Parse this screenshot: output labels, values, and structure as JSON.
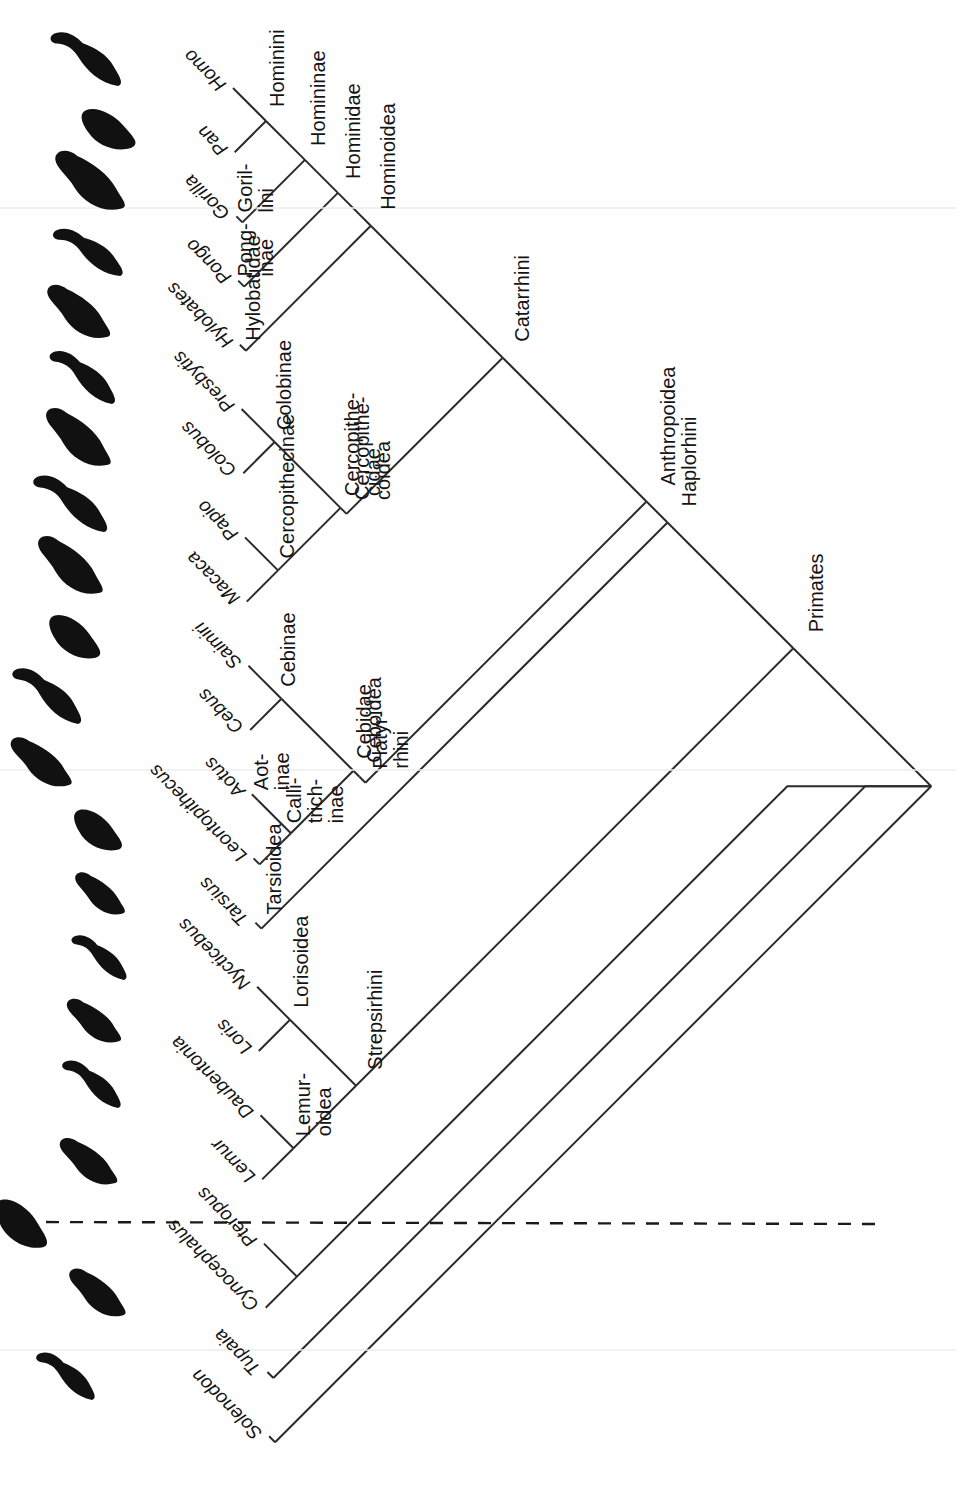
{
  "figure": {
    "type": "cladogram",
    "orientation": "diagonal-45-rotated",
    "root_label": "Primates",
    "background": "#ffffff",
    "line_color": "#2b2b2b",
    "text_color": "#141414"
  },
  "tips": [
    {
      "id": "homo",
      "label": "Homo",
      "index": 0,
      "silhouette": "human-silhouette"
    },
    {
      "id": "pan",
      "label": "Pan",
      "index": 1,
      "silhouette": "chimpanzee-silhouette"
    },
    {
      "id": "gorilla",
      "label": "Gorilla",
      "index": 2,
      "silhouette": "gorilla-silhouette"
    },
    {
      "id": "pongo",
      "label": "Pongo",
      "index": 3,
      "silhouette": "orangutan-silhouette"
    },
    {
      "id": "hylobates",
      "label": "Hylobates",
      "index": 4,
      "silhouette": "gibbon-silhouette"
    },
    {
      "id": "presbytis",
      "label": "Presbytis",
      "index": 5,
      "silhouette": "langur-silhouette"
    },
    {
      "id": "colobus",
      "label": "Colobus",
      "index": 6,
      "silhouette": "colobus-silhouette"
    },
    {
      "id": "papio",
      "label": "Papio",
      "index": 7,
      "silhouette": "baboon-silhouette"
    },
    {
      "id": "macaca",
      "label": "Macaca",
      "index": 8,
      "silhouette": "macaque-silhouette"
    },
    {
      "id": "saimiri",
      "label": "Saimiri",
      "index": 9,
      "silhouette": "squirrel-monkey-silhouette"
    },
    {
      "id": "cebus",
      "label": "Cebus",
      "index": 10,
      "silhouette": "capuchin-silhouette"
    },
    {
      "id": "aotus",
      "label": "Aotus",
      "index": 11,
      "silhouette": "owl-monkey-silhouette"
    },
    {
      "id": "leontopithecus",
      "label": "Leontopithecus",
      "index": 12,
      "silhouette": "tamarin-silhouette"
    },
    {
      "id": "tarsius",
      "label": "Tarsius",
      "index": 13,
      "silhouette": "tarsier-silhouette"
    },
    {
      "id": "nycticebus",
      "label": "Nycticebus",
      "index": 14,
      "silhouette": "slow-loris-silhouette"
    },
    {
      "id": "loris",
      "label": "Loris",
      "index": 15,
      "silhouette": "slender-loris-silhouette"
    },
    {
      "id": "daubentonia",
      "label": "Daubentonia",
      "index": 16,
      "silhouette": "aye-aye-silhouette"
    },
    {
      "id": "lemur",
      "label": "Lemur",
      "index": 17,
      "silhouette": "lemur-silhouette"
    },
    {
      "id": "pteropus",
      "label": "Pteropus",
      "index": 18,
      "silhouette": "flying-fox-silhouette"
    },
    {
      "id": "cynocephalus",
      "label": "Cynocephalus",
      "index": 19,
      "silhouette": "colugo-silhouette"
    },
    {
      "id": "tupaia",
      "label": "Tupaia",
      "index": 20,
      "silhouette": "tree-shrew-silhouette"
    },
    {
      "id": "solenodon",
      "label": "Solenodon",
      "index": 21,
      "silhouette": "solenodon-silhouette"
    }
  ],
  "clades": [
    {
      "id": "hominini",
      "label": "Hominini",
      "lines": [
        "Hominini"
      ]
    },
    {
      "id": "homininae",
      "label": "Homininae",
      "lines": [
        "Homininae"
      ]
    },
    {
      "id": "hominidae",
      "label": "Hominidae",
      "lines": [
        "Hominidae"
      ]
    },
    {
      "id": "gorillini",
      "label": "Gorillini",
      "lines": [
        "Goril-",
        "lini"
      ]
    },
    {
      "id": "ponginae",
      "label": "Ponginae",
      "lines": [
        "Pong-",
        "inae"
      ]
    },
    {
      "id": "hylobatidae",
      "label": "Hylobatidae",
      "lines": [
        "Hylobatidae"
      ]
    },
    {
      "id": "hominoidea",
      "label": "Hominoidea",
      "lines": [
        "Hominoidea"
      ]
    },
    {
      "id": "colobinae",
      "label": "Colobinae",
      "lines": [
        "Colobinae"
      ]
    },
    {
      "id": "cercopithecinae",
      "label": "Cercopithecinae",
      "lines": [
        "Cercopithecinae"
      ]
    },
    {
      "id": "cercopithecidae",
      "label": "Cercopithecidae",
      "lines": [
        "Cercopithe-",
        "cidae"
      ]
    },
    {
      "id": "cercopithecoidea",
      "label": "Cercopithecoidea",
      "lines": [
        "Cercopithe-",
        "coidea"
      ]
    },
    {
      "id": "catarrhini",
      "label": "Catarrhini",
      "lines": [
        "Catarrhini"
      ]
    },
    {
      "id": "cebinae",
      "label": "Cebinae",
      "lines": [
        "Cebinae"
      ]
    },
    {
      "id": "aotinae",
      "label": "Aotinae",
      "lines": [
        "Aot-",
        "inae"
      ]
    },
    {
      "id": "callitrichinae",
      "label": "Callitrichinae",
      "lines": [
        "Calli-",
        "trich-",
        "inae"
      ]
    },
    {
      "id": "cebidae",
      "label": "Cebidae",
      "lines": [
        "Cebidae"
      ]
    },
    {
      "id": "ceboidea",
      "label": "Ceboidea",
      "lines": [
        "Ceboidea"
      ]
    },
    {
      "id": "platyrrhini",
      "label": "Platyrrhini",
      "lines": [
        "Platyr-",
        "rhini"
      ]
    },
    {
      "id": "anthropoidea",
      "label": "Anthropoidea",
      "lines": [
        "Anthropoidea"
      ]
    },
    {
      "id": "tarsioidea",
      "label": "Tarsioidea",
      "lines": [
        "Tarsioidea"
      ]
    },
    {
      "id": "lorisoidea",
      "label": "Lorisoidea",
      "lines": [
        "Lorisoidea"
      ]
    },
    {
      "id": "lemuroidea",
      "label": "Lemuroidea",
      "lines": [
        "Lemur-",
        "oidea"
      ]
    },
    {
      "id": "strepsirhini",
      "label": "Strepsirhini",
      "lines": [
        "Strepsirhini"
      ]
    },
    {
      "id": "haplorhini",
      "label": "Haplorhini",
      "lines": [
        "Haplorhini"
      ]
    },
    {
      "id": "primates",
      "label": "Primates",
      "lines": [
        "Primates"
      ]
    }
  ],
  "annotations": {
    "divider_dashed_line": "crown-primates-divider",
    "scan_artifact_lines": 3
  }
}
